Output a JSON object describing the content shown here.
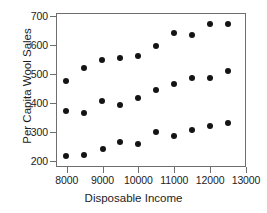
{
  "chart_data": {
    "type": "scatter",
    "title": "",
    "xlabel": "Disposable Income",
    "ylabel": "Per Capita Wool Sales",
    "xlim": [
      7700,
      13000
    ],
    "ylim": [
      180,
      710
    ],
    "xticks": [
      8000,
      9000,
      10000,
      11000,
      12000,
      13000
    ],
    "xtick_labels": [
      "8000",
      "9000",
      "10000",
      "11000",
      "12000",
      "13000"
    ],
    "yticks": [
      200,
      300,
      400,
      500,
      600,
      700
    ],
    "ytick_labels": [
      "200",
      "300",
      "400",
      "500",
      "600",
      "700"
    ],
    "grid": false,
    "legend": false,
    "marker": "filled-circle",
    "marker_color": "#141414",
    "frame_color": "#6e6e6e",
    "background": "#ffffff",
    "points": [
      {
        "x": 7970,
        "y": 475
      },
      {
        "x": 7970,
        "y": 374
      },
      {
        "x": 7990,
        "y": 219
      },
      {
        "x": 8480,
        "y": 522
      },
      {
        "x": 8480,
        "y": 367
      },
      {
        "x": 8490,
        "y": 223
      },
      {
        "x": 8990,
        "y": 547
      },
      {
        "x": 8990,
        "y": 408
      },
      {
        "x": 9000,
        "y": 241
      },
      {
        "x": 9490,
        "y": 556
      },
      {
        "x": 9490,
        "y": 394
      },
      {
        "x": 9490,
        "y": 265
      },
      {
        "x": 9990,
        "y": 561
      },
      {
        "x": 9990,
        "y": 417
      },
      {
        "x": 9990,
        "y": 258
      },
      {
        "x": 10490,
        "y": 595
      },
      {
        "x": 10490,
        "y": 444
      },
      {
        "x": 10490,
        "y": 302
      },
      {
        "x": 10990,
        "y": 640
      },
      {
        "x": 10990,
        "y": 465
      },
      {
        "x": 10990,
        "y": 285
      },
      {
        "x": 11490,
        "y": 634
      },
      {
        "x": 11490,
        "y": 488
      },
      {
        "x": 11490,
        "y": 309
      },
      {
        "x": 11990,
        "y": 671
      },
      {
        "x": 11990,
        "y": 485
      },
      {
        "x": 11990,
        "y": 321
      },
      {
        "x": 12490,
        "y": 671
      },
      {
        "x": 12490,
        "y": 511
      },
      {
        "x": 12490,
        "y": 332
      }
    ]
  }
}
